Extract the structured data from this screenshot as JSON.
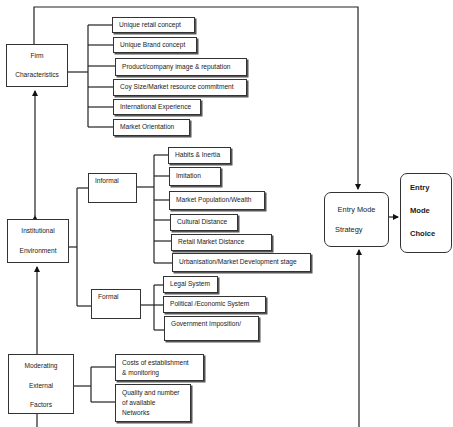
{
  "diagram": {
    "type": "flow-hierarchy",
    "nodes": {
      "firm": {
        "line1": "Firm",
        "line2": "Characteristics"
      },
      "institutional": {
        "line1": "Institutional",
        "line2": "Environment"
      },
      "moderating": {
        "line1": "Moderating",
        "line2": "External",
        "line3": "Factors"
      },
      "informal": {
        "label": "Informal"
      },
      "formal": {
        "label": "Formal"
      },
      "strategy": {
        "line1": "Entry Mode",
        "line2": "Strategy"
      },
      "choice": {
        "line1": "Entry",
        "line2": "Mode",
        "line3": "Choice"
      }
    },
    "firm_factors": [
      "Unique retail concept",
      "Unique Brand concept",
      "Product/company image & reputation",
      "Coy Size/Market resource commitment",
      "International Experience",
      "Market Orientation"
    ],
    "informal_factors": [
      "Habits & Inertia",
      "Imitation",
      "Market Population/Wealth",
      "Cultural Distance",
      "Retail Market Distance",
      "Urbanisation/Market Development stage"
    ],
    "formal_factors": [
      "Legal System",
      "Political /Economic System",
      "Government Imposition/"
    ],
    "moderating_factors": [
      {
        "line1": "Costs of establishment",
        "line2": "& monitoring"
      },
      {
        "line1": "Quality and number",
        "line2": "of available",
        "line3": "Networks"
      }
    ],
    "edges": [
      {
        "from": "Institutional Environment",
        "to": "Firm Characteristics",
        "style": "bidirectional-arrow"
      },
      {
        "from": "Moderating External Factors",
        "to": "Institutional Environment",
        "style": "arrow"
      },
      {
        "from": "Firm Characteristics",
        "to": "Entry Mode Strategy",
        "style": "arrow"
      },
      {
        "from": "Moderating External Factors",
        "to": "Entry Mode Strategy",
        "style": "arrow"
      },
      {
        "from": "Entry Mode Strategy",
        "to": "Entry Mode Choice",
        "style": "arrow"
      },
      {
        "from": "Institutional Environment",
        "to": "Informal",
        "style": "bracket"
      },
      {
        "from": "Institutional Environment",
        "to": "Formal",
        "style": "bracket"
      }
    ]
  }
}
